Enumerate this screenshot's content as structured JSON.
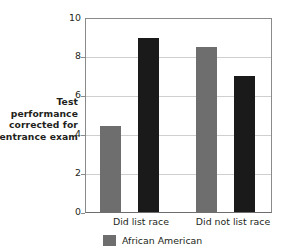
{
  "chart_data": {
    "type": "bar",
    "title": "",
    "subtitle": "",
    "xlabel": "",
    "ylabel": "Test performance corrected for entrance exam",
    "ylabel_lines": [
      "Test",
      "performance",
      "corrected for",
      "entrance exam"
    ],
    "categories": [
      "Did list race",
      "Did not list race"
    ],
    "series": [
      {
        "name": "African American",
        "color": "#6e6e6e",
        "values": [
          4.4,
          8.45
        ]
      },
      {
        "name": "",
        "color": "#1a1a1a",
        "values": [
          8.9,
          7.0
        ]
      }
    ],
    "ylim": [
      0,
      10
    ],
    "yticks": [
      0,
      2,
      4,
      6,
      8,
      10
    ],
    "ytick_labels": [
      "0",
      "2",
      "4",
      "6",
      "8",
      "10"
    ],
    "grid": true,
    "grid_axis": "y",
    "legend_position": "bottom",
    "legend": [
      {
        "label": "African American",
        "color": "#6e6e6e"
      }
    ]
  },
  "colors": {
    "series_gray": "#6e6e6e",
    "series_black": "#1a1a1a",
    "gridline": "#cfcfcf",
    "axis": "#8a8a8a",
    "text": "#231f20",
    "background": "#ffffff"
  }
}
